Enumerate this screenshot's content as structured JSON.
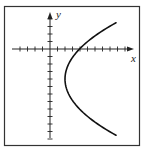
{
  "chart_data": {
    "type": "line",
    "title": "",
    "xlabel": "x",
    "ylabel": "y",
    "grid": false,
    "legend": null,
    "axis_ticks": {
      "x_ticks_negative": 4,
      "x_ticks_positive": 10,
      "y_ticks_positive": 4,
      "y_ticks_negative": 12,
      "tick_labels": "none"
    },
    "xlim": [
      -4.5,
      11
    ],
    "ylim": [
      -12,
      4.8
    ],
    "series": [
      {
        "name": "parabola opening right",
        "equation_approx": "x = 0.12*(y+4)^2 + 2",
        "vertex": [
          2,
          -4
        ],
        "points": [
          {
            "x": 8.8,
            "y": 3.5
          },
          {
            "x": 5.8,
            "y": 1.5
          },
          {
            "x": 3.9,
            "y": 0
          },
          {
            "x": 2.5,
            "y": -2
          },
          {
            "x": 2.0,
            "y": -4
          },
          {
            "x": 2.5,
            "y": -6
          },
          {
            "x": 3.9,
            "y": -8
          },
          {
            "x": 5.8,
            "y": -9.6
          },
          {
            "x": 8.8,
            "y": -11.5
          }
        ]
      }
    ],
    "colors": {
      "curve": "#111111",
      "axes": "#222222",
      "frame": "#333333",
      "background": "#ffffff"
    }
  },
  "labels": {
    "x_axis": "x",
    "y_axis": "y"
  }
}
